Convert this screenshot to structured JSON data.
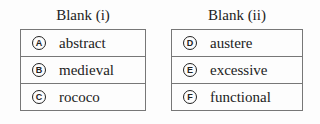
{
  "blanks": [
    {
      "header": "Blank (i)",
      "options": [
        {
          "letter": "A",
          "text": "abstract"
        },
        {
          "letter": "B",
          "text": "medieval"
        },
        {
          "letter": "C",
          "text": "rococo"
        }
      ]
    },
    {
      "header": "Blank (ii)",
      "options": [
        {
          "letter": "D",
          "text": "austere"
        },
        {
          "letter": "E",
          "text": "excessive"
        },
        {
          "letter": "F",
          "text": "functional"
        }
      ]
    }
  ]
}
